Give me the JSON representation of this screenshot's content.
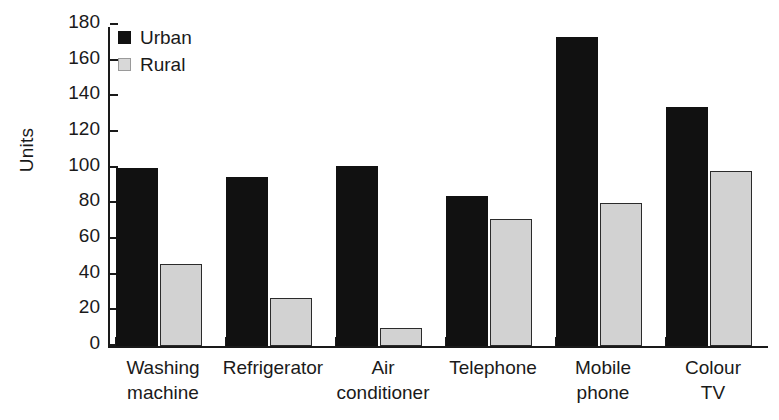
{
  "chart_data": {
    "type": "bar",
    "title": "",
    "xlabel": "",
    "ylabel": "Units",
    "ylim": [
      0,
      180
    ],
    "yticks": [
      0,
      20,
      40,
      60,
      80,
      100,
      120,
      140,
      160,
      180
    ],
    "grid": false,
    "legend_position": "top-left",
    "categories": [
      "Washing\nmachine",
      "Refrigerator",
      "Air\nconditioner",
      "Telephone",
      "Mobile\nphone",
      "Colour\nTV"
    ],
    "series": [
      {
        "name": "Urban",
        "color": "#111111",
        "values": [
          100,
          95,
          101,
          84,
          173,
          134
        ]
      },
      {
        "name": "Rural",
        "color": "#d2d2d2",
        "values": [
          46,
          27,
          10,
          71,
          80,
          98
        ]
      }
    ]
  },
  "legend": {
    "items": [
      {
        "label": "Urban",
        "swatch": "urban"
      },
      {
        "label": "Rural",
        "swatch": "rural"
      }
    ]
  },
  "axis": {
    "y_title": "Units"
  }
}
